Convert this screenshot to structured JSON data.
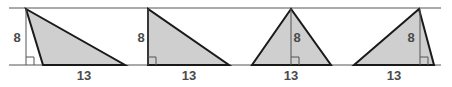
{
  "diagram": {
    "colors": {
      "fill": "#cfcfcf",
      "stroke": "#1a1a1a",
      "guide": "#555555",
      "label": "#4a4a4a"
    },
    "parallel_lines": {
      "top_y": 8,
      "bottom_y": 65,
      "x_start": 9,
      "x_end": 441
    },
    "triangles": [
      {
        "id": "triangle-1",
        "base_label": "13",
        "height_label": "8",
        "apex": [
          26,
          9
        ],
        "base_left": [
          43,
          65
        ],
        "base_right": [
          125,
          65
        ],
        "height_x": 26,
        "height_label_pos": [
          17,
          42
        ],
        "base_label_pos": [
          84,
          80
        ]
      },
      {
        "id": "triangle-2",
        "base_label": "13",
        "height_label": "8",
        "apex": [
          148,
          9
        ],
        "base_left": [
          148,
          65
        ],
        "base_right": [
          229,
          65
        ],
        "height_x": 148,
        "height_label_pos": [
          141,
          42
        ],
        "base_label_pos": [
          189,
          80
        ]
      },
      {
        "id": "triangle-3",
        "base_label": "13",
        "height_label": "8",
        "apex": [
          291,
          9
        ],
        "base_left": [
          252,
          65
        ],
        "base_right": [
          331,
          65
        ],
        "height_x": 291,
        "height_label_pos": [
          297,
          42
        ],
        "base_label_pos": [
          291,
          80
        ]
      },
      {
        "id": "triangle-4",
        "base_label": "13",
        "height_label": "8",
        "apex": [
          419,
          9
        ],
        "base_left": [
          354,
          65
        ],
        "base_right": [
          434,
          65
        ],
        "height_x": 420,
        "height_label_pos": [
          411,
          42
        ],
        "base_label_pos": [
          394,
          80
        ]
      }
    ]
  }
}
